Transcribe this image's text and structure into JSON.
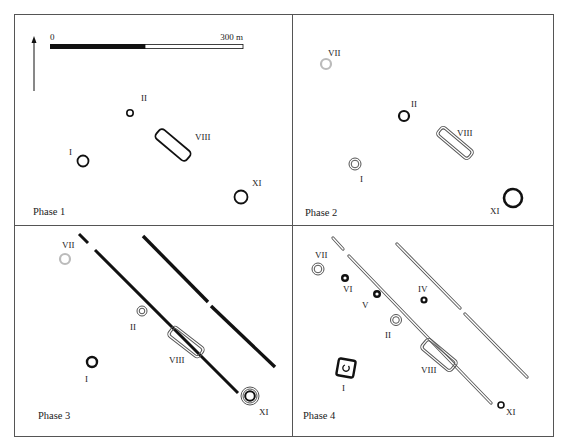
{
  "figure": {
    "width": 562,
    "height": 443,
    "colors": {
      "ink": "#111111",
      "frame": "#555555",
      "faded": "#bbbbbb",
      "double_outline": "#555555",
      "background": "#ffffff"
    },
    "scale_bar": {
      "start_label": "0",
      "end_label": "300 m",
      "x0": 50,
      "x_mid": 145,
      "x1": 243,
      "y": 44,
      "h": 5
    },
    "north_arrow": {
      "x": 34,
      "y_top": 36,
      "y_bottom": 91,
      "icon": "north-arrow-icon"
    },
    "panels": [
      {
        "id": "phase-1",
        "label": "Phase 1",
        "label_pos": [
          33,
          215
        ],
        "features": [
          {
            "id": "II",
            "label": "II",
            "type": "ring",
            "style": "solid",
            "cx": 130,
            "cy": 113,
            "r": 3.2,
            "sw": 1.6,
            "label_pos": [
              141,
              101
            ]
          },
          {
            "id": "VIII",
            "label": "VIII",
            "type": "enclosure",
            "style": "solid",
            "cx": 173,
            "cy": 145,
            "w": 40,
            "h": 12,
            "rot": 40,
            "sw": 1.8,
            "label_pos": [
              195,
              140
            ]
          },
          {
            "id": "I",
            "label": "I",
            "type": "ring",
            "style": "solid",
            "cx": 83,
            "cy": 161,
            "r": 5.5,
            "sw": 1.8,
            "label_pos": [
              69,
              155
            ]
          },
          {
            "id": "XI",
            "label": "XI",
            "type": "ring",
            "style": "solid",
            "cx": 241,
            "cy": 197,
            "r": 6.5,
            "sw": 1.8,
            "label_pos": [
              252,
              186
            ]
          }
        ],
        "ditches": []
      },
      {
        "id": "phase-2",
        "label": "Phase 2",
        "label_pos": [
          305,
          216
        ],
        "features": [
          {
            "id": "VII",
            "label": "VII",
            "type": "ring",
            "style": "faded",
            "cx": 326,
            "cy": 64,
            "r": 5,
            "sw": 2.2,
            "label_pos": [
              328,
              56
            ]
          },
          {
            "id": "II",
            "label": "II",
            "type": "ring",
            "style": "solid",
            "cx": 404,
            "cy": 116,
            "r": 5,
            "sw": 2.2,
            "label_pos": [
              411,
              107
            ]
          },
          {
            "id": "VIII",
            "label": "VIII",
            "type": "enclosure",
            "style": "double",
            "cx": 455,
            "cy": 143,
            "w": 42,
            "h": 12,
            "rot": 40,
            "sw": 1,
            "label_pos": [
              457,
              136
            ]
          },
          {
            "id": "I",
            "label": "I",
            "type": "ring",
            "style": "double",
            "cx": 355,
            "cy": 164,
            "r": 6,
            "sw": 1,
            "label_pos": [
              360,
              182
            ]
          },
          {
            "id": "XI",
            "label": "XI",
            "type": "ring",
            "style": "solid",
            "cx": 513,
            "cy": 198,
            "r": 9,
            "sw": 2.6,
            "label_pos": [
              490,
              214
            ]
          }
        ],
        "ditches": []
      },
      {
        "id": "phase-3",
        "label": "Phase 3",
        "label_pos": [
          38,
          419
        ],
        "features": [
          {
            "id": "VII",
            "label": "VII",
            "type": "ring",
            "style": "faded",
            "cx": 65,
            "cy": 259,
            "r": 5,
            "sw": 2.2,
            "label_pos": [
              62,
              248
            ]
          },
          {
            "id": "II",
            "label": "II",
            "type": "ring",
            "style": "double",
            "cx": 142,
            "cy": 311,
            "r": 5,
            "sw": 1,
            "label_pos": [
              130,
              330
            ]
          },
          {
            "id": "VIII",
            "label": "VIII",
            "type": "enclosure",
            "style": "double",
            "cx": 186,
            "cy": 342,
            "w": 40,
            "h": 13,
            "rot": 38,
            "sw": 1,
            "label_pos": [
              169,
              363
            ]
          },
          {
            "id": "I",
            "label": "I",
            "type": "ring",
            "style": "solid",
            "cx": 92,
            "cy": 362,
            "r": 5,
            "sw": 2.4,
            "label_pos": [
              85,
              382
            ]
          },
          {
            "id": "XI",
            "label": "XI",
            "type": "ring",
            "style": "triple",
            "cx": 250,
            "cy": 396,
            "r": 9,
            "sw": 1,
            "label_pos": [
              259,
              415
            ]
          }
        ],
        "ditches": [
          {
            "name": "ditch-inner",
            "style": "solid",
            "sw": 3,
            "segments": [
              [
                79,
                234,
                88,
                243
              ],
              [
                95,
                250,
                238,
                393
              ]
            ]
          },
          {
            "name": "ditch-outer",
            "style": "solid",
            "sw": 3.4,
            "segments": [
              [
                143,
                236,
                208,
                302
              ],
              [
                211,
                306,
                275,
                367
              ]
            ]
          }
        ]
      },
      {
        "id": "phase-4",
        "label": "Phase 4",
        "label_pos": [
          303,
          419
        ],
        "features": [
          {
            "id": "VII",
            "label": "VII",
            "type": "ring",
            "style": "double",
            "cx": 318,
            "cy": 269,
            "r": 6,
            "sw": 1,
            "label_pos": [
              315,
              258
            ]
          },
          {
            "id": "VI",
            "label": "VI",
            "type": "ring",
            "style": "solid",
            "cx": 345,
            "cy": 278,
            "r": 2.8,
            "sw": 2.4,
            "label_pos": [
              343,
              292
            ]
          },
          {
            "id": "V",
            "label": "V",
            "type": "ring",
            "style": "solid",
            "cx": 377,
            "cy": 294,
            "r": 2.8,
            "sw": 2.4,
            "label_pos": [
              362,
              308
            ]
          },
          {
            "id": "IV",
            "label": "IV",
            "type": "ring",
            "style": "solid",
            "cx": 424,
            "cy": 300,
            "r": 2.5,
            "sw": 2.2,
            "label_pos": [
              418,
              292
            ]
          },
          {
            "id": "II",
            "label": "II",
            "type": "ring",
            "style": "double",
            "cx": 396,
            "cy": 320,
            "r": 5.5,
            "sw": 1,
            "label_pos": [
              385,
              338
            ]
          },
          {
            "id": "VIII",
            "label": "VIII",
            "type": "enclosure",
            "style": "double",
            "cx": 439,
            "cy": 355,
            "w": 40,
            "h": 14,
            "rot": 40,
            "sw": 1,
            "label_pos": [
              421,
              373
            ]
          },
          {
            "id": "I",
            "label": "I",
            "type": "square",
            "style": "solid",
            "cx": 346,
            "cy": 368,
            "s": 17,
            "rot": 10,
            "sw": 2.4,
            "label_pos": [
              342,
              391
            ]
          },
          {
            "id": "XI",
            "label": "XI",
            "type": "ring",
            "style": "solid",
            "cx": 501,
            "cy": 405,
            "r": 3,
            "sw": 1.6,
            "label_pos": [
              506,
              415
            ]
          }
        ],
        "ditches": [
          {
            "name": "ditch-inner",
            "style": "double",
            "sw": 3.2,
            "segments": [
              [
                333,
                238,
                343,
                249
              ],
              [
                349,
                256,
                491,
                403
              ]
            ]
          },
          {
            "name": "ditch-outer",
            "style": "double",
            "sw": 3.2,
            "segments": [
              [
                397,
                244,
                460,
                308
              ],
              [
                465,
                314,
                527,
                377
              ]
            ]
          }
        ]
      }
    ]
  }
}
